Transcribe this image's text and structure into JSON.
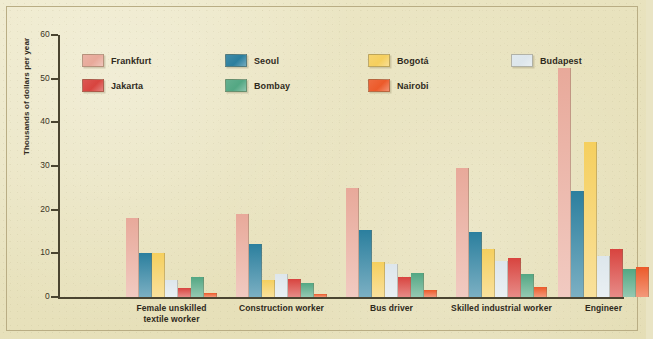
{
  "chart_data": {
    "type": "bar",
    "title": "",
    "xlabel": "",
    "ylabel": "Thousands of dollars per year",
    "ylim": [
      0,
      60
    ],
    "yticks": [
      0,
      10,
      20,
      30,
      40,
      50,
      60
    ],
    "grid": false,
    "legend_position": "top-left",
    "categories": [
      "Female unskilled\ntextile worker",
      "Construction worker",
      "Bus driver",
      "Skilled industrial worker",
      "Engineer"
    ],
    "series": [
      {
        "name": "Frankfurt",
        "color": "#e8a99a",
        "values": [
          18.0,
          19.0,
          25.0,
          29.5,
          52.5
        ]
      },
      {
        "name": "Seoul",
        "color": "#2b7f9e",
        "values": [
          10.0,
          12.2,
          15.3,
          14.8,
          24.2
        ]
      },
      {
        "name": "Bogotá",
        "color": "#f5cf5e",
        "values": [
          10.0,
          3.8,
          8.0,
          11.0,
          35.5
        ]
      },
      {
        "name": "Budapest",
        "color": "#dde6ec",
        "values": [
          4.0,
          5.2,
          7.5,
          8.2,
          9.5
        ]
      },
      {
        "name": "Jakarta",
        "color": "#d8443f",
        "values": [
          2.0,
          4.2,
          4.6,
          9.0,
          11.0
        ]
      },
      {
        "name": "Bombay",
        "color": "#53a783",
        "values": [
          4.6,
          3.1,
          5.6,
          5.2,
          6.4
        ]
      },
      {
        "name": "Nairobi",
        "color": "#ec5a2a",
        "values": [
          1.0,
          0.7,
          1.6,
          2.4,
          6.8
        ]
      }
    ]
  },
  "axis": {
    "y_tick_labels": [
      "60",
      "50",
      "40",
      "30",
      "20",
      "10",
      "0"
    ],
    "y_axis_title": "Thousands of dollars per year"
  },
  "legend": {
    "items": [
      {
        "label": "Frankfurt"
      },
      {
        "label": "Seoul"
      },
      {
        "label": "Bogotá"
      },
      {
        "label": "Budapest"
      },
      {
        "label": "Jakarta"
      },
      {
        "label": "Bombay"
      },
      {
        "label": "Nairobi"
      }
    ]
  }
}
